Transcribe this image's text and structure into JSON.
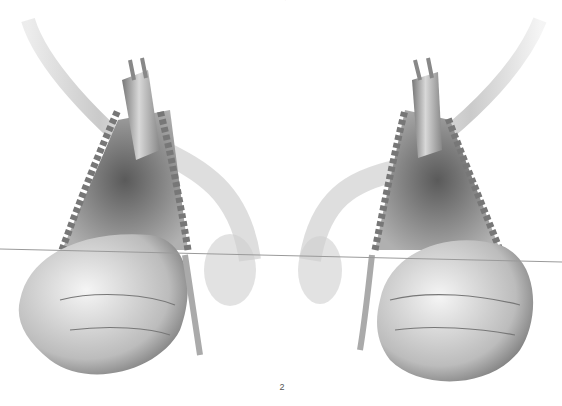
{
  "figure": {
    "page_number": "2",
    "top_mark": "'",
    "panels": [
      {
        "id": "left",
        "description": "Surgical view: retractor lifting tissue edges with a hand gripping and a drainage tube"
      },
      {
        "id": "right",
        "description": "Mirrored surgical view: retractor, hand grip, and curved tube"
      }
    ],
    "colors": {
      "background": "#ffffff",
      "line": "#9a9a9a",
      "ink_dark": "#3a3a3a",
      "ink_mid": "#8a8a8a",
      "ink_light": "#d4d4d4"
    }
  }
}
